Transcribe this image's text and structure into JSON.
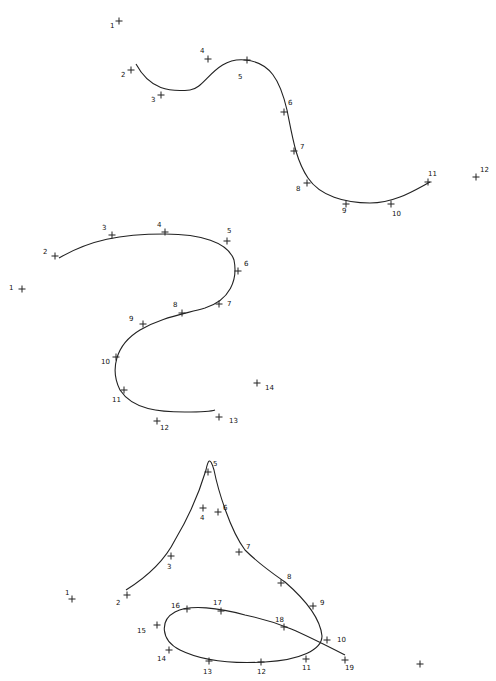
{
  "figures": [
    {
      "name": "figure-curve-1",
      "curve_path": "M 136 64 C 150 90, 170 92, 190 90 C 205 89, 215 57, 245 60 C 270 62, 280 80, 287 110 C 293 140, 296 160, 308 178 C 320 196, 345 203, 370 203 C 395 203, 415 190, 430 182",
      "points": [
        {
          "n": "1",
          "x": 119,
          "y": 21,
          "lx": 110,
          "ly": 28
        },
        {
          "n": "2",
          "x": 131,
          "y": 70,
          "lx": 121,
          "ly": 77
        },
        {
          "n": "3",
          "x": 161,
          "y": 95,
          "lx": 151,
          "ly": 102
        },
        {
          "n": "4",
          "x": 208,
          "y": 59,
          "lx": 200,
          "ly": 53
        },
        {
          "n": "5",
          "x": 247,
          "y": 60,
          "lx": 238,
          "ly": 79
        },
        {
          "n": "6",
          "x": 284,
          "y": 112,
          "lx": 288,
          "ly": 105
        },
        {
          "n": "7",
          "x": 294,
          "y": 151,
          "lx": 300,
          "ly": 149
        },
        {
          "n": "8",
          "x": 307,
          "y": 183,
          "lx": 296,
          "ly": 191
        },
        {
          "n": "9",
          "x": 346,
          "y": 204,
          "lx": 342,
          "ly": 213
        },
        {
          "n": "10",
          "x": 391,
          "y": 204,
          "lx": 392,
          "ly": 216
        },
        {
          "n": "11",
          "x": 428,
          "y": 182,
          "lx": 428,
          "ly": 176
        },
        {
          "n": "12",
          "x": 476,
          "y": 177,
          "lx": 480,
          "ly": 172
        }
      ]
    },
    {
      "name": "figure-curve-2",
      "curve_path": "M 59 258 C 90 240, 120 234, 165 234 C 200 234, 228 242, 234 260 C 238 280, 230 300, 205 308 C 180 315, 160 318, 140 330 C 115 345, 110 370, 120 390 C 133 410, 160 412, 185 412 C 200 412, 210 412, 215 410",
      "points": [
        {
          "n": "1",
          "x": 22,
          "y": 289,
          "lx": 9,
          "ly": 290
        },
        {
          "n": "2",
          "x": 55,
          "y": 256,
          "lx": 43,
          "ly": 254
        },
        {
          "n": "3",
          "x": 112,
          "y": 235,
          "lx": 102,
          "ly": 230
        },
        {
          "n": "4",
          "x": 165,
          "y": 232,
          "lx": 157,
          "ly": 227
        },
        {
          "n": "5",
          "x": 227,
          "y": 241,
          "lx": 227,
          "ly": 233
        },
        {
          "n": "6",
          "x": 238,
          "y": 271,
          "lx": 244,
          "ly": 266
        },
        {
          "n": "7",
          "x": 219,
          "y": 304,
          "lx": 227,
          "ly": 306
        },
        {
          "n": "8",
          "x": 182,
          "y": 313,
          "lx": 173,
          "ly": 307
        },
        {
          "n": "9",
          "x": 143,
          "y": 324,
          "lx": 129,
          "ly": 321
        },
        {
          "n": "10",
          "x": 116,
          "y": 357,
          "lx": 101,
          "ly": 364
        },
        {
          "n": "11",
          "x": 124,
          "y": 390,
          "lx": 112,
          "ly": 402
        },
        {
          "n": "12",
          "x": 157,
          "y": 421,
          "lx": 160,
          "ly": 430
        },
        {
          "n": "13",
          "x": 219,
          "y": 417,
          "lx": 229,
          "ly": 423
        },
        {
          "n": "14",
          "x": 257,
          "y": 383,
          "lx": 265,
          "ly": 390
        }
      ]
    },
    {
      "name": "figure-curve-3",
      "curve_path": "M 126 590 C 150 575, 165 560, 175 540 C 190 515, 200 490, 206 470 C 208 460, 210 456, 214 470 C 218 490, 230 530, 245 550 C 260 565, 275 575, 285 582 C 300 595, 320 615, 322 636 C 322 650, 300 660, 265 662 C 230 664, 200 660, 180 650 C 160 640, 160 620, 175 612 C 190 604, 220 608, 245 615 C 280 622, 300 632, 345 655",
      "points": [
        {
          "n": "1",
          "x": 72,
          "y": 599,
          "lx": 65,
          "ly": 595
        },
        {
          "n": "2",
          "x": 127,
          "y": 595,
          "lx": 116,
          "ly": 605
        },
        {
          "n": "3",
          "x": 171,
          "y": 556,
          "lx": 167,
          "ly": 569
        },
        {
          "n": "4",
          "x": 203,
          "y": 508,
          "lx": 200,
          "ly": 520
        },
        {
          "n": "5",
          "x": 208,
          "y": 472,
          "lx": 213,
          "ly": 466
        },
        {
          "n": "6",
          "x": 218,
          "y": 512,
          "lx": 223,
          "ly": 510
        },
        {
          "n": "7",
          "x": 239,
          "y": 552,
          "lx": 246,
          "ly": 549
        },
        {
          "n": "8",
          "x": 281,
          "y": 583,
          "lx": 287,
          "ly": 579
        },
        {
          "n": "9",
          "x": 313,
          "y": 606,
          "lx": 320,
          "ly": 605
        },
        {
          "n": "10",
          "x": 327,
          "y": 640,
          "lx": 337,
          "ly": 642
        },
        {
          "n": "11",
          "x": 306,
          "y": 659,
          "lx": 302,
          "ly": 670
        },
        {
          "n": "12",
          "x": 261,
          "y": 662,
          "lx": 257,
          "ly": 674
        },
        {
          "n": "13",
          "x": 209,
          "y": 661,
          "lx": 203,
          "ly": 674
        },
        {
          "n": "14",
          "x": 169,
          "y": 650,
          "lx": 157,
          "ly": 661
        },
        {
          "n": "15",
          "x": 157,
          "y": 625,
          "lx": 137,
          "ly": 633
        },
        {
          "n": "16",
          "x": 187,
          "y": 609,
          "lx": 171,
          "ly": 608
        },
        {
          "n": "17",
          "x": 221,
          "y": 611,
          "lx": 213,
          "ly": 605
        },
        {
          "n": "18",
          "x": 284,
          "y": 627,
          "lx": 275,
          "ly": 622
        },
        {
          "n": "19",
          "x": 345,
          "y": 660,
          "lx": 345,
          "ly": 670
        },
        {
          "n": "",
          "x": 420,
          "y": 664,
          "lx": 0,
          "ly": 0
        }
      ]
    }
  ]
}
